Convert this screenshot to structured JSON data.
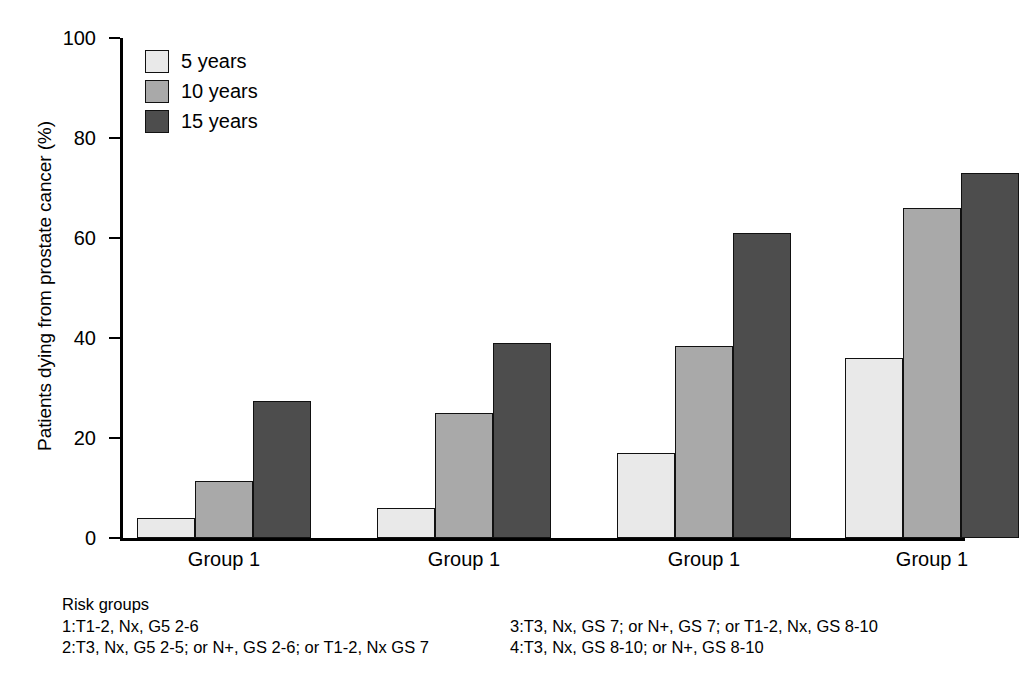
{
  "chart_data": {
    "type": "bar",
    "title": "",
    "xlabel": "",
    "ylabel": "Patients dying from prostate cancer (%)",
    "ylim": [
      0,
      100
    ],
    "yticks": [
      0,
      20,
      40,
      60,
      80,
      100
    ],
    "ytick_labels": [
      "0",
      "20",
      "40",
      "60",
      "80",
      "100"
    ],
    "grid": false,
    "legend_position": "top-left",
    "categories": [
      "Group 1",
      "Group 1",
      "Group 1",
      "Group 1"
    ],
    "series": [
      {
        "name": "5 years",
        "color": "#e9e9e9",
        "values": [
          4,
          6,
          17,
          36
        ]
      },
      {
        "name": "10 years",
        "color": "#a9a9a9",
        "values": [
          11.5,
          25,
          38.5,
          66
        ]
      },
      {
        "name": "15 years",
        "color": "#4d4d4d",
        "values": [
          27.5,
          39,
          61,
          73
        ]
      }
    ]
  },
  "legend": {
    "items": [
      {
        "label": "5 years"
      },
      {
        "label": "10 years"
      },
      {
        "label": "15 years"
      }
    ]
  },
  "caption": {
    "title": "Risk groups",
    "left_lines": [
      "1:T1-2, Nx, G5 2-6",
      "2:T3, Nx, G5 2-5; or N+, GS 2-6; or T1-2, Nx GS 7"
    ],
    "right_lines": [
      "3:T3, Nx, GS 7; or N+, GS 7; or T1-2, Nx, GS 8-10",
      "4:T3, Nx, GS 8-10; or N+, GS 8-10"
    ]
  }
}
